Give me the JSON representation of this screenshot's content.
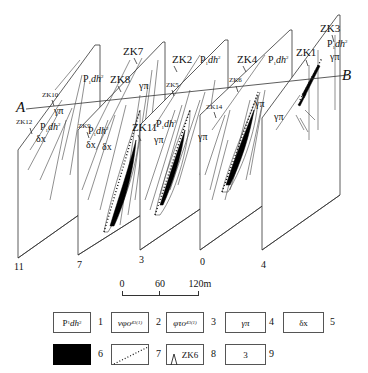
{
  "diagram": {
    "type": "geological fence diagram (cross-sections)",
    "profile_line": {
      "start_label": "A",
      "end_label": "B"
    },
    "drill_holes": [
      "ZK1",
      "ZK2",
      "ZK3",
      "ZK4",
      "ZK5",
      "ZK6",
      "ZK7",
      "ZK8",
      "ZK9",
      "ZK10",
      "ZK11",
      "ZK12",
      "ZK14"
    ],
    "drill_hole_labels": {
      "zk7": "ZK7",
      "zk8": "ZK8",
      "zk2": "ZK2",
      "zk4": "ZK4",
      "zk1": "ZK1",
      "zk3": "ZK3",
      "zk10": "ZK10",
      "zk12": "ZK12",
      "zk9": "ZK9",
      "zk11": "ZK11",
      "zk5": "ZK5",
      "zk6": "ZK6",
      "zk14": "ZK14"
    },
    "rock_labels": {
      "p1dh2_prefix": "P",
      "p1dh2_sub": "1",
      "p1dh2_main": "dh",
      "p1dh2_sup": "2",
      "gamma_pi": "γπ",
      "delta_x": "δx"
    },
    "section_lines": [
      "11",
      "7",
      "3",
      "0",
      "4"
    ]
  },
  "scale_bar": {
    "ticks": [
      "0",
      "60",
      "120m"
    ]
  },
  "legend": {
    "items": [
      {
        "num": "1",
        "label_prefix": "P",
        "label_sub": "1",
        "label_main": "dh",
        "label_sup": "2"
      },
      {
        "num": "2",
        "label_main": "νφο",
        "label_sub": "4",
        "label_sup": "3(1)"
      },
      {
        "num": "3",
        "label_main": "φτο",
        "label_sub": "4",
        "label_sup": "3(1)"
      },
      {
        "num": "4",
        "label_main": "γπ"
      },
      {
        "num": "5",
        "label_main": "δx"
      },
      {
        "num": "6",
        "swatch": "solid-black"
      },
      {
        "num": "7",
        "swatch": "dotted-diagonal"
      },
      {
        "num": "8",
        "label_main": "ZK6",
        "swatch": "drillhole-symbol"
      },
      {
        "num": "9",
        "label_main": "3"
      }
    ]
  }
}
